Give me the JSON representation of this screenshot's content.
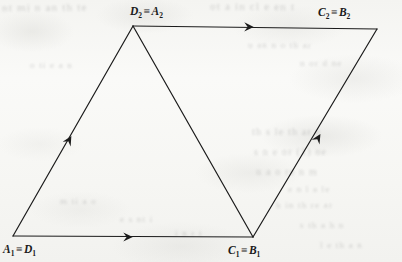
{
  "figure": {
    "kind": "geometry-diagram",
    "background_color": "#f5f5f2",
    "ink_color": "#1b1b1b",
    "stroke_width": 1.2,
    "vertices": [
      {
        "id": "bottom-left",
        "label_main": "A",
        "label_main_sub": "1",
        "label_alt": "D",
        "label_alt_sub": "1",
        "x": 13,
        "y": 236
      },
      {
        "id": "top-left",
        "label_main": "D",
        "label_main_sub": "2",
        "label_alt": "A",
        "label_alt_sub": "2",
        "x": 133,
        "y": 26
      },
      {
        "id": "top-right",
        "label_main": "C",
        "label_main_sub": "2",
        "label_alt": "B",
        "label_alt_sub": "2",
        "x": 377,
        "y": 29
      },
      {
        "id": "bottom-mid",
        "label_main": "C",
        "label_main_sub": "1",
        "label_alt": "B",
        "label_alt_sub": "1",
        "x": 253,
        "y": 237
      }
    ],
    "equivalence_symbol": "≡",
    "labels": {
      "top_left": {
        "text": "D₂ ≡ A₂",
        "x": 130,
        "y": 5
      },
      "top_right": {
        "text": "C₂ ≡ B₂",
        "x": 318,
        "y": 6
      },
      "bottom_left": {
        "text": "A₁ ≡ D₁",
        "x": 3,
        "y": 243
      },
      "bottom_right": {
        "text": "C₁ ≡ B₁",
        "x": 228,
        "y": 244
      }
    },
    "edges": [
      {
        "id": "bottom-edge",
        "from": "bottom-left",
        "to": "bottom-mid",
        "arrow": true,
        "arrow_direction": "right",
        "arrow_x": 128,
        "arrow_y": 237
      },
      {
        "id": "left-edge",
        "from": "bottom-left",
        "to": "top-left",
        "arrow": true,
        "arrow_direction": "up-right",
        "arrow_x": 69,
        "arrow_y": 140
      },
      {
        "id": "top-edge",
        "from": "top-left",
        "to": "top-right",
        "arrow": true,
        "arrow_direction": "right",
        "arrow_x": 249,
        "arrow_y": 27
      },
      {
        "id": "right-edge",
        "from": "bottom-mid",
        "to": "top-right",
        "arrow": true,
        "arrow_direction": "up-right",
        "arrow_x": 318,
        "arrow_y": 138
      },
      {
        "id": "diagonal-edge",
        "from": "top-left",
        "to": "bottom-mid",
        "arrow": false,
        "arrow_direction": "none",
        "arrow_x": 0,
        "arrow_y": 0
      }
    ],
    "ghost_text": [
      {
        "text": "nt  mi  n  an  th  te",
        "x": 2,
        "y": 1,
        "size": 11,
        "rotate": -0.4
      },
      {
        "text": "ot  a  in  cl  e  en  t",
        "x": 210,
        "y": 0,
        "size": 11,
        "rotate": 0.2
      },
      {
        "text": "u  an  n  o  th  ar",
        "x": 248,
        "y": 40,
        "size": 9,
        "rotate": 0.3
      },
      {
        "text": "n  or  d  ne",
        "x": 300,
        "y": 58,
        "size": 9,
        "rotate": -0.2
      },
      {
        "text": "th  s  le  th  ar  e",
        "x": 252,
        "y": 126,
        "size": 10,
        "rotate": 0.1
      },
      {
        "text": "s  n  e  or  (1)  ne",
        "x": 254,
        "y": 146,
        "size": 10,
        "rotate": -0.3
      },
      {
        "text": "u  a  o  re  n  m",
        "x": 256,
        "y": 166,
        "size": 10,
        "rotate": 0.2
      },
      {
        "text": "e  n  l  a  le",
        "x": 288,
        "y": 184,
        "size": 9,
        "rotate": 0.1
      },
      {
        "text": "h  in  th  re  ar",
        "x": 276,
        "y": 200,
        "size": 9,
        "rotate": -0.2
      },
      {
        "text": "s  th  a  h  n",
        "x": 300,
        "y": 220,
        "size": 9,
        "rotate": 0.2
      },
      {
        "text": "m  ti  a  o",
        "x": 60,
        "y": 196,
        "size": 9,
        "rotate": 0.1
      },
      {
        "text": "e  s  nt  i",
        "x": 120,
        "y": 214,
        "size": 9,
        "rotate": -0.1
      },
      {
        "text": "o  ti  e  a  n",
        "x": 30,
        "y": 60,
        "size": 9,
        "rotate": 0.2
      },
      {
        "text": "i  n  r  t",
        "x": 175,
        "y": 228,
        "size": 9,
        "rotate": 0.1
      },
      {
        "text": "l  e  th  a  n",
        "x": 320,
        "y": 240,
        "size": 9,
        "rotate": -0.2
      }
    ]
  }
}
